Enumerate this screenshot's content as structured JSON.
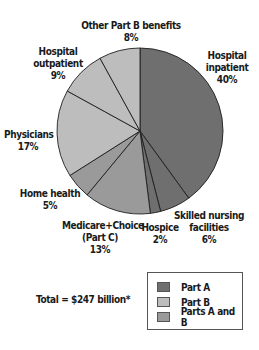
{
  "chart_data": {
    "type": "pie",
    "title": "",
    "start_angle_deg": 0,
    "direction": "clockwise",
    "slices": [
      {
        "label": "Hospital inpatient",
        "value": 40,
        "display": "40%",
        "group": "Part A"
      },
      {
        "label": "Skilled nursing facilities",
        "value": 6,
        "display": "6%",
        "group": "Part A"
      },
      {
        "label": "Hospice",
        "value": 2,
        "display": "2%",
        "group": "Part A"
      },
      {
        "label": "Medicare+Choice (Part C)",
        "value": 13,
        "display": "13%",
        "group": "Parts A and B"
      },
      {
        "label": "Home health",
        "value": 5,
        "display": "5%",
        "group": "Parts A and B"
      },
      {
        "label": "Physicians",
        "value": 17,
        "display": "17%",
        "group": "Part B"
      },
      {
        "label": "Hospital outpatient",
        "value": 9,
        "display": "9%",
        "group": "Part B"
      },
      {
        "label": "Other Part B benefits",
        "value": 8,
        "display": "8%",
        "group": "Part B"
      }
    ],
    "legend": [
      {
        "label": "Part A",
        "color": "#6f6f6f"
      },
      {
        "label": "Part B",
        "color": "#bdbdbd"
      },
      {
        "label": "Parts A and B",
        "color": "#9a9a9a"
      }
    ],
    "legend_position": "bottom-right",
    "annotation": "Total = $247 billion*"
  },
  "labels": {
    "hospital_inpatient": "Hospital\ninpatient\n40%",
    "skilled_nursing": "Skilled nursing\nfacilities\n6%",
    "hospice": "Hospice\n2%",
    "medicare_choice": "Medicare+Choice\n(Part C)\n13%",
    "home_health": "Home health\n5%",
    "physicians": "Physicians\n17%",
    "hospital_outpatient": "Hospital\noutpatient\n9%",
    "other_part_b": "Other Part B benefits\n8%"
  },
  "legend": {
    "part_a": "Part A",
    "part_b": "Part B",
    "parts_ab": "Parts A and B"
  },
  "total_text": "Total = $247 billion*",
  "colors": {
    "part_a": "#6f6f6f",
    "part_b": "#bdbdbd",
    "parts_ab": "#9a9a9a",
    "stroke": "#1e1e1e"
  }
}
